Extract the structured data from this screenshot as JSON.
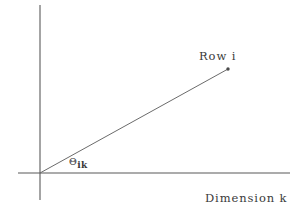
{
  "figure": {
    "type": "vector-diagram",
    "background_color": "#ffffff",
    "line_color": "#555555",
    "text_color": "#3a3a3a"
  },
  "labels": {
    "row": "Row i",
    "dimension": "Dimension k",
    "angle_symbol": "Θ",
    "angle_subscript": "ik"
  },
  "geometry": {
    "origin": {
      "x": 40,
      "y": 173
    },
    "y_axis": {
      "x": 40,
      "y_top": 5,
      "y_bottom": 200
    },
    "x_axis": {
      "y": 173,
      "x_left": 18,
      "x_right": 290
    },
    "ray": {
      "x1": 40,
      "y1": 173,
      "x2": 228,
      "y2": 69
    },
    "endpoint_marker": {
      "x": 228,
      "y": 69,
      "radius": 1.6
    }
  }
}
